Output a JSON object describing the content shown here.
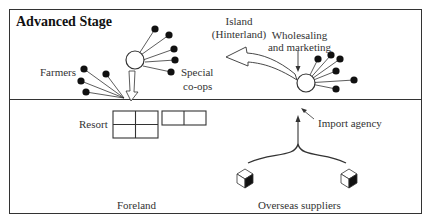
{
  "diagram": {
    "title": "Advanced Stage",
    "upper_region": {
      "labels": {
        "island": "Island",
        "hinterland": "(Hinterland)",
        "farmers": "Farmers",
        "special": "Special",
        "coops": "co-ops",
        "wholesaling": "Wholesaling",
        "marketing": "and marketing"
      }
    },
    "lower_region": {
      "labels": {
        "resort": "Resort",
        "import_agency": "Import agency",
        "foreland": "Foreland",
        "overseas_suppliers": "Overseas suppliers"
      }
    },
    "icons": [
      "node-circle",
      "dot",
      "hollow-arrow",
      "arrow",
      "cube",
      "resort-grid"
    ],
    "colors": {
      "stroke": "#333333",
      "fill_dot": "#111111",
      "background": "#ffffff"
    }
  }
}
